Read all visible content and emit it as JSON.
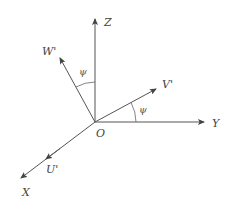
{
  "diagram": {
    "type": "coordinate-frame-rotation",
    "origin": {
      "label": "O",
      "x": 95,
      "y": 122
    },
    "axes": [
      {
        "id": "Z",
        "label": "Z",
        "tip": [
          95,
          18
        ],
        "label_pos": [
          104,
          26
        ]
      },
      {
        "id": "Y",
        "label": "Y",
        "tip": [
          205,
          122
        ],
        "label_pos": [
          212,
          127
        ]
      },
      {
        "id": "X",
        "label": "X",
        "tip": [
          20,
          179
        ],
        "label_pos": [
          22,
          196
        ]
      },
      {
        "id": "W'",
        "label": "W'",
        "tip": [
          59,
          57
        ],
        "label_pos": [
          42,
          55
        ]
      },
      {
        "id": "V'",
        "label": "V'",
        "tip": [
          157,
          88
        ],
        "label_pos": [
          162,
          88
        ]
      },
      {
        "id": "U'",
        "label": "U'",
        "tip": [
          45,
          160
        ],
        "label_pos": [
          46,
          173
        ]
      }
    ],
    "angles": [
      {
        "label": "ψ",
        "between": [
          "Z",
          "W'"
        ],
        "label_pos": [
          79,
          75
        ]
      },
      {
        "label": "ψ",
        "between": [
          "V'",
          "Y"
        ],
        "label_pos": [
          139,
          113
        ]
      }
    ]
  }
}
